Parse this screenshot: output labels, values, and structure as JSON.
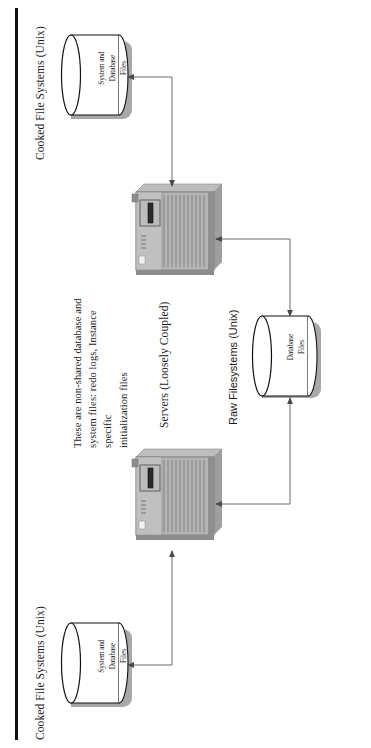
{
  "diagram": {
    "orientation": "rotated-90",
    "colors": {
      "border_rule": "#111111",
      "shape_fill": "#b7b7b7",
      "shape_shadow": "#9a9a9a",
      "shape_stroke": "#3a3a3a",
      "connector": "#5a5a5a",
      "text": "#1a1a1a",
      "page_background": "#ffffff"
    },
    "labels": {
      "cooked_top": "Cooked File Systems (Unix)",
      "cooked_bottom": "Cooked File Systems (Unix)",
      "servers": "Servers (Loosely Coupled)",
      "raw": "Raw Filesystems (Unix)"
    },
    "note": {
      "line1": "These are non-shared database and",
      "line2": "system files: redo logs, Instance specific",
      "line3": "initialization files"
    },
    "cylinders": [
      {
        "id": "cooked-top",
        "line1": "System and",
        "line2": "Database",
        "line3": "Files"
      },
      {
        "id": "raw-middle",
        "line1": "Database",
        "line2": "Files",
        "line3": ""
      },
      {
        "id": "cooked-bottom",
        "line1": "System and",
        "line2": "Database",
        "line3": "Files"
      }
    ],
    "servers": [
      {
        "id": "server-top",
        "name": "server-node-1"
      },
      {
        "id": "server-bottom",
        "name": "server-node-2"
      }
    ],
    "connectors": [
      {
        "id": "c1",
        "from": "server-top",
        "to": "cooked-top",
        "arrows": "both"
      },
      {
        "id": "c2",
        "from": "server-top",
        "to": "raw-middle",
        "arrows": "both"
      },
      {
        "id": "c3",
        "from": "server-bottom",
        "to": "raw-middle",
        "arrows": "both"
      },
      {
        "id": "c4",
        "from": "server-bottom",
        "to": "cooked-bottom",
        "arrows": "both"
      }
    ]
  }
}
